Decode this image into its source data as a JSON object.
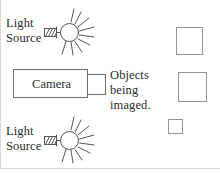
{
  "figure": {
    "background": "#ffffff",
    "line_color": "#6e6e6e",
    "text_color": "#2b2b2b"
  },
  "light_sources": [
    {
      "id": "light-source-top",
      "label": "Light\nSource",
      "icon": "sun-lamp-icon",
      "position": "top-left"
    },
    {
      "id": "light-source-bottom",
      "label": "Light\nSource",
      "icon": "sun-lamp-icon",
      "position": "bottom-left"
    }
  ],
  "camera": {
    "label": "Camera",
    "body_shape": "rectangle",
    "lens_shape": "rectangle",
    "lens_side": "right"
  },
  "objects": {
    "label": "Objects\nbeing\nimaged.",
    "squares": [
      {
        "id": "object-square-top",
        "size": "medium"
      },
      {
        "id": "object-square-middle",
        "size": "large"
      },
      {
        "id": "object-square-bottom",
        "size": "small"
      }
    ]
  }
}
